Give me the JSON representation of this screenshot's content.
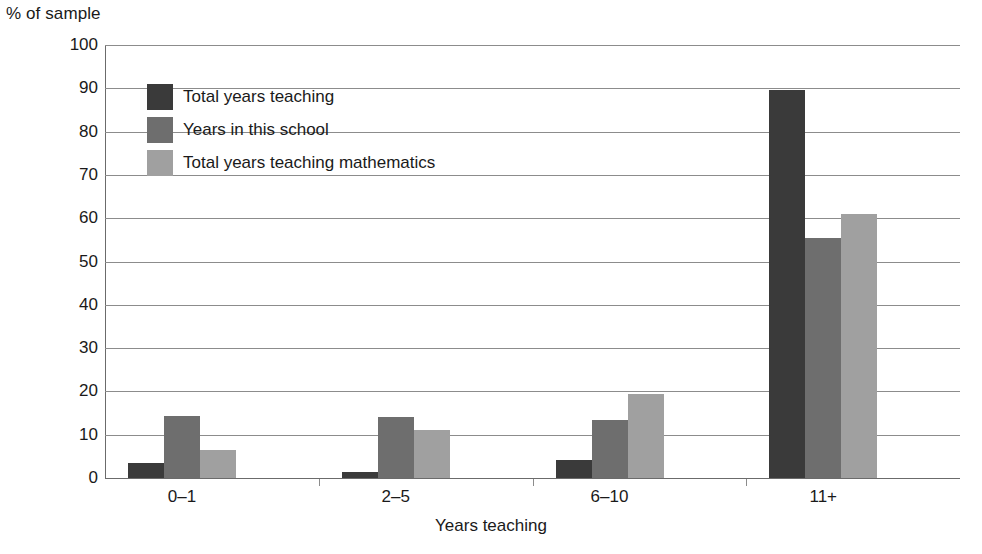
{
  "chart_data": {
    "type": "bar",
    "title": "",
    "xlabel": "Years teaching",
    "ylabel": "% of sample",
    "categories": [
      "0–1",
      "2–5",
      "6–10",
      "11+"
    ],
    "series": [
      {
        "name": "Total years teaching",
        "color": "#3a3a3a",
        "values": [
          3.5,
          1.3,
          4.2,
          89.5
        ]
      },
      {
        "name": "Years in this school",
        "color": "#6e6e6e",
        "values": [
          14.3,
          14.0,
          13.5,
          55.5
        ]
      },
      {
        "name": "Total years teaching mathematics",
        "color": "#a0a0a0",
        "values": [
          6.5,
          11.0,
          19.3,
          61.0
        ]
      }
    ],
    "ylim": [
      0,
      100
    ],
    "ytick_labels": [
      "100",
      "90",
      "80",
      "70",
      "60",
      "50",
      "40",
      "30",
      "20",
      "10",
      "0"
    ],
    "ytick_values": [
      100,
      90,
      80,
      70,
      60,
      50,
      40,
      30,
      20,
      10,
      0
    ],
    "grid": true,
    "legend_position": "upper-left-inside",
    "grid_color": "#8c8c8c",
    "axis_color": "#6b6b6b",
    "background": "#ffffff"
  },
  "axes": {
    "y_title": "% of sample",
    "x_title": "Years teaching"
  },
  "legend": {
    "items": [
      {
        "label": "Total years teaching",
        "color": "#3a3a3a"
      },
      {
        "label": "Years in this school",
        "color": "#6e6e6e"
      },
      {
        "label": "Total years teaching mathematics",
        "color": "#a0a0a0"
      }
    ]
  }
}
